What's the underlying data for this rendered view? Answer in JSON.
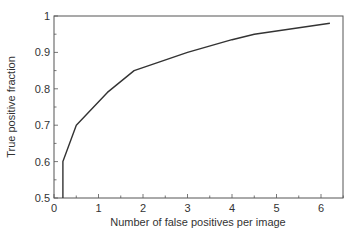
{
  "chart_data": {
    "type": "line",
    "title": "",
    "xlabel": "Number of false positives per image",
    "ylabel": "True positive fraction",
    "xlim": [
      0,
      6.5
    ],
    "ylim": [
      0.5,
      1.0
    ],
    "xticks": [
      0,
      1,
      2,
      3,
      4,
      5,
      6
    ],
    "xtick_labels": [
      "0",
      "1",
      "2",
      "3",
      "4",
      "5",
      "6"
    ],
    "yticks": [
      0.5,
      0.6,
      0.7,
      0.8,
      0.9,
      1.0
    ],
    "ytick_labels": [
      "0.5",
      "0.6",
      "0.7",
      "0.8",
      "0.9",
      "1"
    ],
    "grid": false,
    "legend": null,
    "series": [
      {
        "name": "FROC curve",
        "color": "#333333",
        "x": [
          0.2,
          0.2,
          0.5,
          1.2,
          1.8,
          3.0,
          4.0,
          4.5,
          6.2
        ],
        "y": [
          0.5,
          0.6,
          0.7,
          0.79,
          0.85,
          0.9,
          0.935,
          0.95,
          0.98
        ]
      }
    ]
  }
}
